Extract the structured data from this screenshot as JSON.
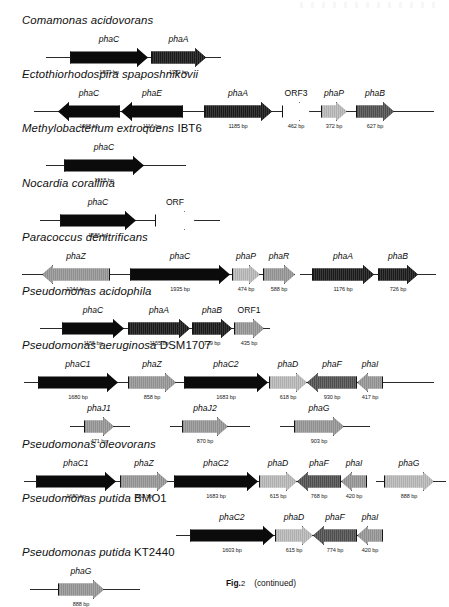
{
  "figure": {
    "caption_label": "Fig.",
    "caption_number": "2",
    "caption_note": "(continued)"
  },
  "units": "bp",
  "organisms": [
    {
      "id": "comamonas-acidovorans",
      "name": "Comamonas acidovorans",
      "strain": "",
      "top": 14,
      "tracks": [
        {
          "left": 46,
          "width": 175,
          "top": 22,
          "genes": [
            {
              "label": "phaC",
              "size": "1893 bp",
              "dir": "right",
              "fill": "f-black",
              "x": 24,
              "w": 78
            },
            {
              "label": "phaA",
              "size": "1182 bp",
              "dir": "right",
              "fill": "f-dark",
              "x": 105,
              "w": 55
            }
          ]
        }
      ]
    },
    {
      "id": "ectothiorhodospira-spaposhnikovii",
      "name": "Ectothiorhodospira spaposhnikovii",
      "strain": "",
      "top": 68,
      "tracks": [
        {
          "left": 34,
          "width": 400,
          "top": 22,
          "genes": [
            {
              "label": "phaC",
              "size": "1068 bp",
              "dir": "left",
              "fill": "f-black",
              "x": 24,
              "w": 62
            },
            {
              "label": "phaE",
              "size": "1116 bp",
              "dir": "left",
              "fill": "f-black",
              "x": 87,
              "w": 62
            },
            {
              "label": "phaA",
              "size": "1185 bp",
              "dir": "right",
              "fill": "f-dark",
              "x": 170,
              "w": 68
            },
            {
              "label": "ORF3",
              "size": "462 bp",
              "dir": "right",
              "fill": "f-white",
              "x": 248,
              "w": 28,
              "plain": true
            },
            {
              "label": "phaP",
              "size": "372 bp",
              "dir": "right",
              "fill": "f-light",
              "x": 287,
              "w": 26
            },
            {
              "label": "phaB",
              "size": "627 bp",
              "dir": "right",
              "fill": "f-mid",
              "x": 322,
              "w": 38
            }
          ]
        }
      ]
    },
    {
      "id": "methylobacterium-extroquens",
      "name": "Methylobacterium extroquens",
      "strain": "IBT6",
      "top": 122,
      "tracks": [
        {
          "left": 46,
          "width": 140,
          "top": 22,
          "genes": [
            {
              "label": "phaC",
              "size": "1918 bp",
              "dir": "right",
              "fill": "f-black",
              "x": 18,
              "w": 80
            }
          ]
        }
      ]
    },
    {
      "id": "nocardia-corallina",
      "name": "Nocardia corallina",
      "strain": "",
      "top": 177,
      "tracks": [
        {
          "left": 40,
          "width": 180,
          "top": 22,
          "genes": [
            {
              "label": "phaC",
              "size": "1686 bp",
              "dir": "right",
              "fill": "f-black",
              "x": 20,
              "w": 76
            },
            {
              "label": "ORF",
              "size": "",
              "dir": "right",
              "fill": "f-white",
              "x": 115,
              "w": 40,
              "plain": true
            }
          ]
        }
      ]
    },
    {
      "id": "paracoccus-denitrificans",
      "name": "Paracoccus denitrificans",
      "strain": "",
      "top": 231,
      "tracks": [
        {
          "left": 22,
          "width": 260,
          "top": 22,
          "genes": [
            {
              "label": "phaZ",
              "size": "1344 bp",
              "dir": "left",
              "fill": "f-gray",
              "x": 20,
              "w": 68
            },
            {
              "label": "phaC",
              "size": "1935 bp",
              "dir": "right",
              "fill": "f-black",
              "x": 108,
              "w": 100
            },
            {
              "label": "phaP",
              "size": "474 bp",
              "dir": "right",
              "fill": "f-light",
              "x": 210,
              "w": 28
            },
            {
              "label": "phaR",
              "size": "588 bp",
              "dir": "right",
              "fill": "f-gray",
              "x": 241,
              "w": 32
            }
          ]
        },
        {
          "left": 300,
          "width": 136,
          "top": 22,
          "genes": [
            {
              "label": "phaA",
              "size": "1176 bp",
              "dir": "right",
              "fill": "f-dark",
              "x": 12,
              "w": 62
            },
            {
              "label": "phaB",
              "size": "726 bp",
              "dir": "right",
              "fill": "f-dark",
              "x": 78,
              "w": 40
            }
          ]
        }
      ]
    },
    {
      "id": "pseudomonas-acidophila",
      "name": "Pseudomonas acidophila",
      "strain": "",
      "top": 285,
      "tracks": [
        {
          "left": 40,
          "width": 230,
          "top": 22,
          "genes": [
            {
              "label": "phaC",
              "size": "1155 bp",
              "dir": "right",
              "fill": "f-black",
              "x": 22,
              "w": 62
            },
            {
              "label": "phaA",
              "size": "1155 bp",
              "dir": "right",
              "fill": "f-dark",
              "x": 88,
              "w": 62
            },
            {
              "label": "phaB",
              "size": "729 bp",
              "dir": "right",
              "fill": "f-dark",
              "x": 152,
              "w": 40
            },
            {
              "label": "ORF1",
              "size": "435 bp",
              "dir": "right",
              "fill": "f-gray",
              "x": 194,
              "w": 30,
              "plain": true
            }
          ]
        }
      ]
    },
    {
      "id": "pseudomonas-aeruginosa-dsm1707",
      "name": "Pseudomonas aeruginosa",
      "strain": "DSM1707",
      "top": 339,
      "tracks": [
        {
          "left": 24,
          "width": 410,
          "top": 22,
          "genes": [
            {
              "label": "phaC1",
              "size": "1680 bp",
              "dir": "right",
              "fill": "f-black",
              "x": 14,
              "w": 80
            },
            {
              "label": "phaZ",
              "size": "858 bp",
              "dir": "right",
              "fill": "f-gray",
              "x": 104,
              "w": 48
            },
            {
              "label": "phaC2",
              "size": "1683 bp",
              "dir": "right",
              "fill": "f-black",
              "x": 160,
              "w": 84
            },
            {
              "label": "phaD",
              "size": "618 bp",
              "dir": "right",
              "fill": "f-light",
              "x": 245,
              "w": 38
            },
            {
              "label": "phaF",
              "size": "930 bp",
              "dir": "left",
              "fill": "f-mid",
              "x": 283,
              "w": 50
            },
            {
              "label": "phaI",
              "size": "417 bp",
              "dir": "left",
              "fill": "f-gray",
              "x": 333,
              "w": 26
            }
          ]
        },
        {
          "left": 70,
          "width": 60,
          "top": 66,
          "genes": [
            {
              "label": "phaJ1",
              "size": "471 bp",
              "dir": "right",
              "fill": "f-gray",
              "x": 14,
              "w": 30
            }
          ]
        },
        {
          "left": 170,
          "width": 80,
          "top": 66,
          "genes": [
            {
              "label": "phaJ2",
              "size": "870 bp",
              "dir": "right",
              "fill": "f-gray",
              "x": 12,
              "w": 46
            }
          ]
        },
        {
          "left": 280,
          "width": 90,
          "top": 66,
          "genes": [
            {
              "label": "phaG",
              "size": "903 bp",
              "dir": "right",
              "fill": "f-gray",
              "x": 14,
              "w": 50
            }
          ]
        }
      ]
    },
    {
      "id": "pseudomonas-oleovorans",
      "name": "Pseudomonas oleovorans",
      "strain": "",
      "top": 438,
      "tracks": [
        {
          "left": 24,
          "width": 330,
          "top": 22,
          "genes": [
            {
              "label": "phaC1",
              "size": "1680 bp",
              "dir": "right",
              "fill": "f-black",
              "x": 12,
              "w": 80
            },
            {
              "label": "phaZ",
              "size": "852 bp",
              "dir": "right",
              "fill": "f-gray",
              "x": 96,
              "w": 48
            },
            {
              "label": "phaC2",
              "size": "1683 bp",
              "dir": "right",
              "fill": "f-black",
              "x": 150,
              "w": 84
            },
            {
              "label": "phaD",
              "size": "615 bp",
              "dir": "right",
              "fill": "f-light",
              "x": 235,
              "w": 38
            },
            {
              "label": "phaF",
              "size": "768 bp",
              "dir": "left",
              "fill": "f-mid",
              "x": 273,
              "w": 44
            },
            {
              "label": "phaI",
              "size": "420 bp",
              "dir": "left",
              "fill": "f-gray",
              "x": 317,
              "w": 26
            }
          ]
        },
        {
          "left": 376,
          "width": 70,
          "top": 22,
          "genes": [
            {
              "label": "phaG",
              "size": "888 bp",
              "dir": "right",
              "fill": "f-light",
              "x": 8,
              "w": 50
            }
          ]
        }
      ]
    },
    {
      "id": "pseudomonas-putida-bmo1",
      "name": "Pseudomonas putida",
      "strain": "BMO1",
      "top": 492,
      "tracks": [
        {
          "left": 176,
          "width": 200,
          "top": 22,
          "genes": [
            {
              "label": "phaC2",
              "size": "1603 bp",
              "dir": "right",
              "fill": "f-black",
              "x": 14,
              "w": 84
            },
            {
              "label": "phaD",
              "size": "615 bp",
              "dir": "right",
              "fill": "f-light",
              "x": 99,
              "w": 38
            },
            {
              "label": "phaF",
              "size": "774 bp",
              "dir": "left",
              "fill": "f-mid",
              "x": 137,
              "w": 44
            },
            {
              "label": "phaI",
              "size": "420 bp",
              "dir": "left",
              "fill": "f-gray",
              "x": 181,
              "w": 26
            }
          ]
        }
      ]
    },
    {
      "id": "pseudomonas-putida-kt2440",
      "name": "Pseudomonas putida",
      "strain": "KT2440",
      "top": 546,
      "tracks": [
        {
          "left": 30,
          "width": 110,
          "top": 22,
          "genes": [
            {
              "label": "phaG",
              "size": "888 bp",
              "dir": "right",
              "fill": "f-gray",
              "x": 28,
              "w": 46
            }
          ]
        }
      ]
    }
  ]
}
